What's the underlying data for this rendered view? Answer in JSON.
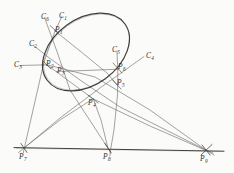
{
  "figure": {
    "type": "geometry-diagram",
    "canvas": {
      "width": 234,
      "height": 173
    },
    "style": {
      "background": "#fbfbf9",
      "conic_stroke": "#3a3836",
      "line_stroke": "#5d5a57",
      "baseline_stroke": "#4a4846",
      "label_color": "#2e2c2b"
    },
    "conic": {
      "name": "ellipse",
      "center": [
        86,
        52
      ],
      "radius_x": 48,
      "radius_y": 33,
      "rotation_deg": -36
    },
    "points": [
      {
        "id": "P1",
        "label": "P",
        "sub": "1",
        "x": 54,
        "y": 30,
        "lx": 55,
        "ly": 28
      },
      {
        "id": "P2",
        "label": "P",
        "sub": "2",
        "x": 47,
        "y": 65,
        "lx": 46,
        "ly": 62
      },
      {
        "id": "P3",
        "label": "P",
        "sub": "3",
        "x": 57,
        "y": 72,
        "lx": 57,
        "ly": 69
      },
      {
        "id": "P4",
        "label": "P",
        "sub": "4",
        "x": 93,
        "y": 99,
        "lx": 89,
        "ly": 99
      },
      {
        "id": "P5",
        "label": "P",
        "sub": "5",
        "x": 116,
        "y": 85,
        "lx": 115,
        "ly": 82
      },
      {
        "id": "P6",
        "label": "P",
        "sub": "6",
        "x": 118,
        "y": 69,
        "lx": 117,
        "ly": 66
      },
      {
        "id": "P7",
        "label": "P",
        "sub": "7",
        "x": 24,
        "y": 148,
        "lx": 19,
        "ly": 154
      },
      {
        "id": "P8",
        "label": "P",
        "sub": "8",
        "x": 108,
        "y": 148,
        "lx": 104,
        "ly": 154
      },
      {
        "id": "P9",
        "label": "P",
        "sub": "9",
        "x": 206,
        "y": 150,
        "lx": 201,
        "ly": 156
      }
    ],
    "lines": [
      {
        "id": "C1",
        "label": "C",
        "sub": "1",
        "lx": 59,
        "ly": 13
      },
      {
        "id": "C2",
        "label": "C",
        "sub": "2",
        "lx": 30,
        "ly": 41
      },
      {
        "id": "C3",
        "label": "C",
        "sub": "3",
        "lx": 15,
        "ly": 62
      },
      {
        "id": "C4",
        "label": "C",
        "sub": "4",
        "lx": 146,
        "ly": 53
      },
      {
        "id": "C5",
        "label": "C",
        "sub": "5",
        "lx": 113,
        "ly": 48
      },
      {
        "id": "C6",
        "label": "C",
        "sub": "6",
        "lx": 41,
        "ly": 13
      }
    ],
    "baseline": {
      "from": [
        16,
        148
      ],
      "to": [
        224,
        151
      ]
    }
  }
}
